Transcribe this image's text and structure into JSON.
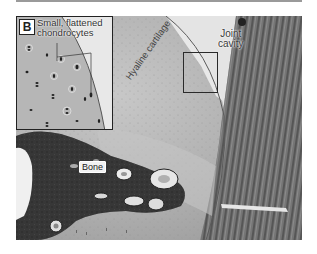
{
  "figure": {
    "panel_letter": "B",
    "labels": {
      "inset_caption_line1": "Small, flattened",
      "inset_caption_line2": "chondrocytes",
      "hyaline": "Hyaline cartilage",
      "joint_line1": "Joint",
      "joint_line2": "cavity",
      "bone": "Bone"
    },
    "colors": {
      "cartilage": "#b8b8b8",
      "joint_cavity": "#e6e6e6",
      "bone": "#3a3a3a",
      "synovium": "#6e6e6e",
      "border": "#222222"
    }
  }
}
